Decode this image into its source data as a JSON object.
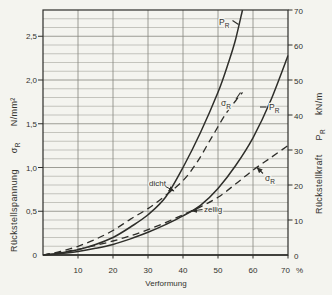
{
  "chart_data": {
    "type": "line",
    "title": "",
    "xlabel": "Verformung",
    "x_unit": "%",
    "xlim": [
      0,
      70
    ],
    "x_ticks": [
      {
        "v": 10,
        "t": "10"
      },
      {
        "v": 20,
        "t": "20"
      },
      {
        "v": 30,
        "t": "30"
      },
      {
        "v": 40,
        "t": "40"
      },
      {
        "v": 50,
        "t": "50"
      },
      {
        "v": 60,
        "t": "60"
      },
      {
        "v": 70,
        "t": "70"
      }
    ],
    "y_left": {
      "label": "Rückstellspannung",
      "symbol": "σ",
      "symbol_sub": "R",
      "unit": "N/mm²",
      "lim": [
        0,
        2.8
      ],
      "ticks": [
        {
          "v": 0,
          "t": "0"
        },
        {
          "v": 0.5,
          "t": "0,5"
        },
        {
          "v": 1.0,
          "t": "1,0"
        },
        {
          "v": 1.5,
          "t": "1,5"
        },
        {
          "v": 2.0,
          "t": "2,0"
        },
        {
          "v": 2.5,
          "t": "2,5"
        }
      ],
      "grid_step": 0.1
    },
    "y_right": {
      "label": "Rückstellkraft",
      "symbol": "P",
      "symbol_sub": "R",
      "unit": "kN/m",
      "lim": [
        0,
        70
      ],
      "ticks": [
        {
          "v": 0,
          "t": "0"
        },
        {
          "v": 10,
          "t": "10"
        },
        {
          "v": 20,
          "t": "20"
        },
        {
          "v": 30,
          "t": "30"
        },
        {
          "v": 40,
          "t": "40"
        },
        {
          "v": 50,
          "t": "50"
        },
        {
          "v": 60,
          "t": "60"
        },
        {
          "v": 70,
          "t": "70"
        }
      ]
    },
    "grid": {
      "v_step_pct": 10,
      "on": true
    },
    "legend_position": "none",
    "series": [
      {
        "name": "PR dicht",
        "material": "dicht",
        "quantity": "PR",
        "axis": "right",
        "style": "solid",
        "points": [
          [
            0,
            0
          ],
          [
            5,
            0.6
          ],
          [
            10,
            1.5
          ],
          [
            15,
            3
          ],
          [
            20,
            5
          ],
          [
            25,
            8
          ],
          [
            30,
            11.5
          ],
          [
            35,
            16.5
          ],
          [
            40,
            25
          ],
          [
            45,
            35
          ],
          [
            50,
            46.5
          ],
          [
            53,
            55
          ],
          [
            55,
            61.5
          ],
          [
            57,
            70
          ]
        ]
      },
      {
        "name": "σR dicht",
        "material": "dicht",
        "quantity": "σR",
        "axis": "left",
        "style": "dashed",
        "points": [
          [
            0,
            0
          ],
          [
            5,
            0.04
          ],
          [
            10,
            0.1
          ],
          [
            15,
            0.18
          ],
          [
            20,
            0.28
          ],
          [
            25,
            0.41
          ],
          [
            30,
            0.53
          ],
          [
            35,
            0.68
          ],
          [
            40,
            0.85
          ],
          [
            44,
            1.06
          ],
          [
            48,
            1.33
          ],
          [
            52,
            1.6
          ],
          [
            55,
            1.76
          ],
          [
            57,
            1.86
          ]
        ]
      },
      {
        "name": "PR zellig",
        "material": "zellig",
        "quantity": "PR",
        "axis": "right",
        "style": "solid",
        "points": [
          [
            0,
            0
          ],
          [
            5,
            0.4
          ],
          [
            10,
            1
          ],
          [
            15,
            1.9
          ],
          [
            20,
            3
          ],
          [
            25,
            4.6
          ],
          [
            30,
            6.5
          ],
          [
            35,
            8.7
          ],
          [
            40,
            11.2
          ],
          [
            45,
            14.2
          ],
          [
            50,
            19
          ],
          [
            55,
            25.5
          ],
          [
            60,
            33.5
          ],
          [
            65,
            44
          ],
          [
            70,
            57
          ]
        ]
      },
      {
        "name": "σR zellig",
        "material": "zellig",
        "quantity": "σR",
        "axis": "left",
        "style": "dashed",
        "points": [
          [
            0,
            0
          ],
          [
            5,
            0.03
          ],
          [
            10,
            0.065
          ],
          [
            15,
            0.11
          ],
          [
            20,
            0.16
          ],
          [
            25,
            0.22
          ],
          [
            30,
            0.29
          ],
          [
            35,
            0.37
          ],
          [
            40,
            0.46
          ],
          [
            45,
            0.55
          ],
          [
            50,
            0.66
          ],
          [
            55,
            0.81
          ],
          [
            60,
            0.97
          ],
          [
            65,
            1.11
          ],
          [
            70,
            1.25
          ]
        ]
      }
    ],
    "curve_labels": [
      {
        "main": "P",
        "sub": "R",
        "series": "PR dicht",
        "x": 219,
        "y": 25,
        "connector": [
          [
            232.5,
            20.5
          ],
          [
            238.5,
            24.5
          ]
        ],
        "arrow": false
      },
      {
        "main": "σ",
        "sub": "R",
        "series": "σR dicht",
        "x": 221,
        "y": 106,
        "connector": [
          [
            236,
            99
          ],
          [
            240.5,
            92.5
          ]
        ],
        "arrow": false
      },
      {
        "main": "P",
        "sub": "R",
        "series": "PR zellig",
        "x": 269,
        "y": 110,
        "connector": [
          [
            260,
            107
          ],
          [
            266.5,
            107
          ]
        ],
        "arrow": false
      },
      {
        "main": "σ",
        "sub": "R",
        "series": "σR zellig",
        "x": 265,
        "y": 181,
        "connector": [
          [
            263,
            173.5
          ],
          [
            257,
            167.5
          ]
        ],
        "arrow": true
      }
    ],
    "region_labels": [
      {
        "text": "dicht",
        "x": 149,
        "y": 186,
        "pointer": [
          [
            165.5,
            186.5
          ],
          [
            174,
            191
          ]
        ],
        "arrow": true
      },
      {
        "text": "zellig",
        "x": 204,
        "y": 212,
        "pointer": [
          [
            202.5,
            209.5
          ],
          [
            191.5,
            211
          ]
        ],
        "arrow": true
      }
    ]
  },
  "colors": {
    "background": "#f4f4ef",
    "ink": "#2e2e2a",
    "grid_minor": "#a3a29a",
    "grid_major": "#87867d"
  }
}
